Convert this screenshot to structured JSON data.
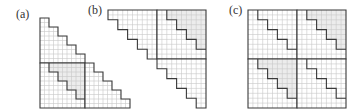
{
  "figure": {
    "width": 363,
    "height": 111,
    "grid_cells_per_block": 10,
    "step_size_cells": 2,
    "colors": {
      "grid_line": "#c8c8c8",
      "outline": "#3a3a3a",
      "shade": "#ececec",
      "background": "#ffffff"
    }
  },
  "panels": [
    {
      "id": "a",
      "label": "(a)",
      "label_x": 16,
      "label_y": 8,
      "x": 40,
      "y": 18,
      "cell": 4.5,
      "blocks": [
        {
          "row": 0,
          "col": 0,
          "type": "lower-stair",
          "shaded": false
        },
        {
          "row": 1,
          "col": 0,
          "type": "full-square-stair-upper",
          "shaded": true
        },
        {
          "row": 1,
          "col": 1,
          "type": "lower-stair",
          "shaded": false
        }
      ]
    },
    {
      "id": "b",
      "label": "(b)",
      "label_x": 88,
      "label_y": 4,
      "x": 108,
      "y": 10,
      "cell": 4.9,
      "blocks": [
        {
          "row": 0,
          "col": 0,
          "type": "upper-stair",
          "shaded": false
        },
        {
          "row": 0,
          "col": 1,
          "type": "full-square-stair-lower",
          "shaded": true
        },
        {
          "row": 1,
          "col": 1,
          "type": "upper-stair",
          "shaded": false
        }
      ]
    },
    {
      "id": "c",
      "label": "(c)",
      "label_x": 229,
      "label_y": 4,
      "x": 248,
      "y": 10,
      "cell": 4.9,
      "blocks": [
        {
          "row": 0,
          "col": 0,
          "type": "full-square-stair-upper-diag",
          "shaded": false
        },
        {
          "row": 0,
          "col": 1,
          "type": "full-square-stair-upper-diag",
          "shaded": true
        },
        {
          "row": 1,
          "col": 0,
          "type": "full-square-stair-upper-diag",
          "shaded": true
        },
        {
          "row": 1,
          "col": 1,
          "type": "full-square-stair-upper-diag",
          "shaded": false
        }
      ]
    }
  ]
}
